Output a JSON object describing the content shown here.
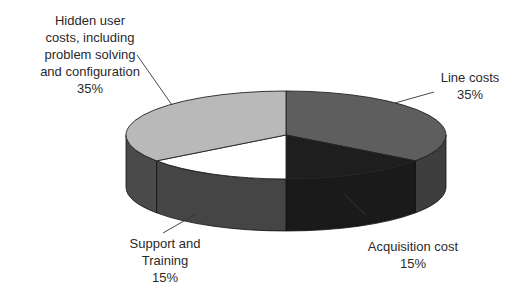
{
  "chart_data": {
    "type": "pie",
    "style": "3d-pie",
    "title": "",
    "categories": [
      "Hidden user costs, including problem solving and configuration",
      "Line costs",
      "Acquisition cost",
      "Support and Training"
    ],
    "values": [
      35,
      35,
      15,
      15
    ],
    "unit": "%",
    "colors": [
      "#b9b9b9",
      "#5e5e5e",
      "#1e1e1e",
      "#ffffff"
    ],
    "side_colors": [
      "#4a4a4a",
      "#3e3e3e",
      "#1a1a1a",
      "#454545"
    ],
    "legend": "none (callout labels)"
  },
  "labels": {
    "hidden": {
      "lines": [
        "Hidden user",
        "costs, including",
        "problem solving",
        "and configuration"
      ],
      "pct": "35%"
    },
    "line": {
      "lines": [
        "Line costs"
      ],
      "pct": "35%"
    },
    "acquisition": {
      "lines": [
        "Acquisition cost"
      ],
      "pct": "15%"
    },
    "support": {
      "lines": [
        "Support and",
        "Training"
      ],
      "pct": "15%"
    }
  }
}
